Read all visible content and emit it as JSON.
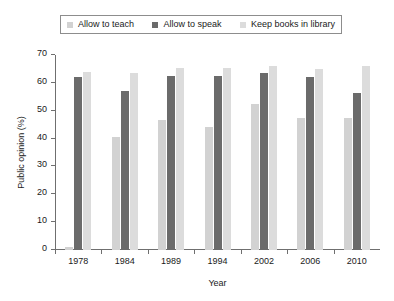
{
  "chart_data": {
    "type": "bar",
    "title": "",
    "subtitle": "",
    "xlabel": "Year",
    "ylabel": "Public opinion (%)",
    "categories": [
      "1978",
      "1984",
      "1989",
      "1994",
      "2002",
      "2006",
      "2010"
    ],
    "series": [
      {
        "name": "Allow to teach",
        "color": "#d2d2d2",
        "values": [
          1,
          40.5,
          46.5,
          44,
          52.5,
          47.5,
          47.5
        ]
      },
      {
        "name": "Allow to speak",
        "color": "#6b6b6b",
        "values": [
          62,
          57,
          62.5,
          62.5,
          63.5,
          62,
          56.5
        ]
      },
      {
        "name": "Keep books in library",
        "color": "#dcdcdc",
        "values": [
          64,
          63.5,
          65.5,
          65.5,
          66,
          65,
          66
        ]
      }
    ],
    "ylim": [
      0,
      70
    ],
    "yticks": [
      0,
      10,
      20,
      30,
      40,
      50,
      60,
      70
    ],
    "ytick_labels": [
      "0",
      "10",
      "20",
      "30",
      "40",
      "50",
      "60",
      "70"
    ],
    "grid": false,
    "legend_position": "top",
    "legend_entries": [
      {
        "label": "Allow to teach",
        "color": "#d2d2d2"
      },
      {
        "label": "Allow to speak",
        "color": "#6b6b6b"
      },
      {
        "label": "Keep books in library",
        "color": "#dcdcdc"
      }
    ],
    "axis_color": "#6f6f6f",
    "background_color": "#ffffff"
  }
}
